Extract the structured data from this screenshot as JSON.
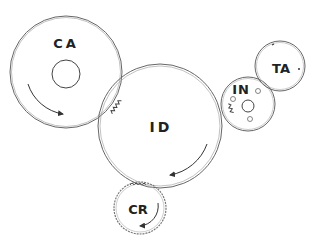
{
  "diagram": {
    "type": "gear-train",
    "colors": {
      "line": "#555555",
      "text": "#222222",
      "background": "#ffffff"
    },
    "gears": [
      {
        "id": "CA",
        "label": "CA",
        "cx": 66,
        "cy": 72,
        "r": 56,
        "hub_r": 13,
        "rotation": "counter-clockwise"
      },
      {
        "id": "ID",
        "label": "ID",
        "cx": 160,
        "cy": 126,
        "r": 62,
        "rotation": "clockwise"
      },
      {
        "id": "IN",
        "label": "IN",
        "cx": 248,
        "cy": 104,
        "r": 27,
        "hub_r": 6,
        "rotation": "counter-clockwise"
      },
      {
        "id": "TA",
        "label": "TA",
        "cx": 280,
        "cy": 66,
        "r": 25,
        "rotation": "clockwise"
      },
      {
        "id": "CR",
        "label": "CR",
        "cx": 140,
        "cy": 208,
        "r": 26,
        "rotation": "counter-clockwise"
      }
    ]
  }
}
